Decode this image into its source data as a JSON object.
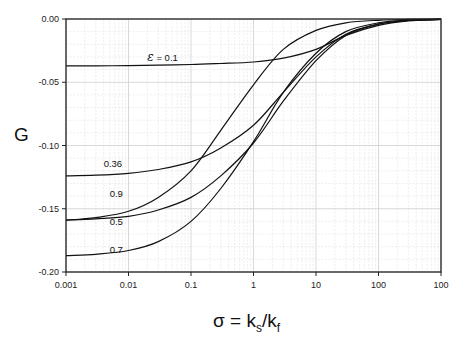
{
  "chart_data": {
    "type": "line",
    "title": "",
    "xlabel": "σ = k_s/k_f",
    "xlabel_parts": {
      "main": "σ = k",
      "sub1": "s",
      "slash": "/k",
      "sub2": "f"
    },
    "ylabel": "G",
    "xscale": "log",
    "xlim": [
      0.001,
      1000
    ],
    "ylim": [
      -0.2,
      0.0
    ],
    "grid": true,
    "legend": "inline curve labels",
    "x_ticks": [
      0.001,
      0.01,
      0.1,
      1,
      10,
      100,
      1000
    ],
    "x_tick_labels": [
      "0.001",
      "0.01",
      "0.1",
      "1",
      "10",
      "100",
      "100"
    ],
    "y_ticks": [
      0.0,
      -0.05,
      -0.1,
      -0.15,
      -0.2
    ],
    "y_tick_labels": [
      "0.00",
      "-0.05",
      "-0.10",
      "-0.15",
      "-0.20"
    ],
    "x": [
      0.001,
      0.003,
      0.01,
      0.03,
      0.1,
      0.3,
      1,
      3,
      10,
      30,
      100,
      300,
      1000
    ],
    "series": [
      {
        "name": "ε = 0.1",
        "label": "ε = 0.1",
        "values": [
          -0.037,
          -0.037,
          -0.0368,
          -0.0365,
          -0.036,
          -0.0352,
          -0.034,
          -0.031,
          -0.024,
          -0.013,
          -0.005,
          -0.0015,
          -0.0003
        ]
      },
      {
        "name": "0.36",
        "label": "0.36",
        "values": [
          -0.124,
          -0.1235,
          -0.122,
          -0.119,
          -0.113,
          -0.102,
          -0.084,
          -0.058,
          -0.03,
          -0.012,
          -0.004,
          -0.0012,
          -0.0003
        ]
      },
      {
        "name": "0.9",
        "label": "0.9",
        "values": [
          -0.159,
          -0.157,
          -0.152,
          -0.141,
          -0.12,
          -0.088,
          -0.052,
          -0.024,
          -0.009,
          -0.003,
          -0.001,
          -0.0003,
          -0.0001
        ]
      },
      {
        "name": "0.5",
        "label": "0.5",
        "values": [
          -0.159,
          -0.158,
          -0.156,
          -0.151,
          -0.141,
          -0.124,
          -0.098,
          -0.065,
          -0.033,
          -0.013,
          -0.004,
          -0.0012,
          -0.0003
        ]
      },
      {
        "name": "0.7",
        "label": "0.7",
        "values": [
          -0.187,
          -0.186,
          -0.183,
          -0.176,
          -0.16,
          -0.134,
          -0.097,
          -0.058,
          -0.027,
          -0.01,
          -0.003,
          -0.0009,
          -0.0002
        ]
      }
    ],
    "annotations": [
      {
        "text": "ε = 0.1",
        "x": 0.02,
        "y": -0.033
      },
      {
        "text": "0.36",
        "x": 0.004,
        "y": -0.117
      },
      {
        "text": "0.9",
        "x": 0.005,
        "y": -0.141
      },
      {
        "text": "0.5",
        "x": 0.005,
        "y": -0.163
      },
      {
        "text": "0.7",
        "x": 0.005,
        "y": -0.185
      }
    ]
  }
}
